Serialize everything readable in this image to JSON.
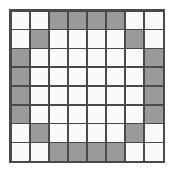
{
  "figure": {
    "title": "",
    "type": "grid-pattern",
    "shape_description": "octagonal ring outline on an 8 by 8 square grid",
    "rows": 8,
    "columns": 8,
    "colors": {
      "filled": "#9a9a9a",
      "empty": "#fafafa",
      "gridline": "#4a4a4a",
      "background": "#ffffff"
    },
    "legend": {
      "filled_label": "shaded",
      "empty_label": "unshaded"
    },
    "counts": {
      "filled": 20,
      "empty": 44,
      "total": 64
    },
    "grid": [
      [
        0,
        0,
        1,
        1,
        1,
        1,
        0,
        0
      ],
      [
        0,
        1,
        0,
        0,
        0,
        0,
        1,
        0
      ],
      [
        1,
        0,
        0,
        0,
        0,
        0,
        0,
        1
      ],
      [
        1,
        0,
        0,
        0,
        0,
        0,
        0,
        1
      ],
      [
        1,
        0,
        0,
        0,
        0,
        0,
        0,
        1
      ],
      [
        1,
        0,
        0,
        0,
        0,
        0,
        0,
        1
      ],
      [
        0,
        1,
        0,
        0,
        0,
        0,
        1,
        0
      ],
      [
        0,
        0,
        1,
        1,
        1,
        1,
        0,
        0
      ]
    ]
  }
}
